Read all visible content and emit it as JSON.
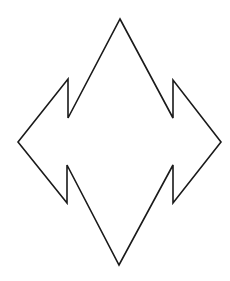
{
  "figure": {
    "type": "line-drawing",
    "shape": {
      "name": "four-way-zigzag-diamond",
      "stroke_color": "#1a1a1a",
      "stroke_width": 1.6,
      "fill": "none",
      "points": [
        [
          120,
          19
        ],
        [
          173,
          118
        ],
        [
          173,
          80
        ],
        [
          221,
          142
        ],
        [
          173,
          203
        ],
        [
          173,
          165
        ],
        [
          119,
          265
        ],
        [
          67,
          165
        ],
        [
          67,
          203
        ],
        [
          18,
          142
        ],
        [
          68,
          79
        ],
        [
          68,
          118
        ]
      ]
    },
    "background": "#ffffff"
  }
}
